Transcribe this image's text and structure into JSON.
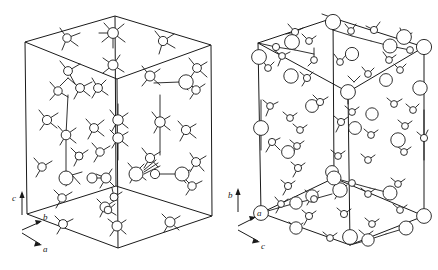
{
  "figure": {
    "type": "crystal-structure-diagram",
    "panel_count": 2,
    "background_color": "#ffffff",
    "line_color": "#1a1a1a",
    "atom_fill_color": "#ffffff"
  },
  "panels": [
    {
      "id": "left-unit-cell",
      "name": "left-structure",
      "cell_shape": "parallelepiped",
      "projection": "oblique",
      "axes": {
        "vertical": {
          "label": "c",
          "direction": "up"
        },
        "upper_right": {
          "label": "b",
          "direction": "upper-right"
        },
        "lower_right": {
          "label": "a",
          "direction": "lower-right"
        }
      },
      "atom_species": [
        {
          "name": "large-atom",
          "radius_px": 7.0
        },
        {
          "name": "medium-atom",
          "radius_px": 5.0
        },
        {
          "name": "small-atom",
          "radius_px": 3.6
        }
      ],
      "description": "Tall vertical parallelepiped unit cell, c axis vertical, densely populated with tetrahedrally coordinated atoms and bonds"
    },
    {
      "id": "right-unit-cell",
      "name": "right-structure",
      "cell_shape": "parallelepiped",
      "projection": "oblique",
      "axes": {
        "vertical": {
          "label": "b",
          "direction": "up"
        },
        "upper_right": {
          "label": "a",
          "direction": "upper-right"
        },
        "lower_right": {
          "label": "c",
          "direction": "lower-right"
        }
      },
      "atom_species": [
        {
          "name": "large-atom",
          "radius_px": 7.5
        },
        {
          "name": "medium-atom",
          "radius_px": 5.0
        },
        {
          "name": "small-atom",
          "radius_px": 3.2
        }
      ],
      "description": "Tall vertical parallelepiped unit cell, b axis vertical, with large cations on cell edges alternating with small anions"
    }
  ],
  "geometry": {
    "left_cell": {
      "corners": {
        "top_back": [
          115,
          16
        ],
        "top_left": [
          25,
          42
        ],
        "top_right": [
          211,
          45
        ],
        "top_front": [
          117,
          79
        ],
        "bot_left": [
          27,
          214
        ],
        "bot_right": [
          212,
          216
        ],
        "bot_front": [
          118,
          248
        ],
        "bot_back": [
          116,
          186
        ]
      }
    },
    "right_cell": {
      "corners": {
        "top_back": [
          333,
          18
        ],
        "top_left": [
          258,
          43
        ],
        "top_right": [
          424,
          47
        ],
        "top_front": [
          348,
          92
        ],
        "bot_left": [
          261,
          213
        ],
        "bot_right": [
          424,
          216
        ],
        "bot_front": [
          350,
          245
        ],
        "bot_back": [
          334,
          178
        ]
      }
    }
  }
}
